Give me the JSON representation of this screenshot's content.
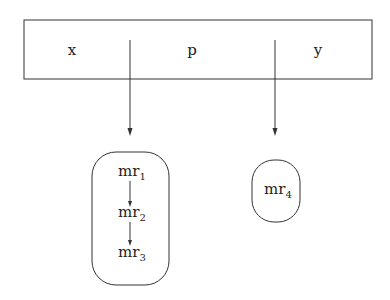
{
  "record": {
    "fields": [
      {
        "label": "x"
      },
      {
        "label": "p"
      },
      {
        "label": "y"
      }
    ]
  },
  "groups": [
    {
      "items": [
        {
          "base": "mr",
          "sub": "1"
        },
        {
          "base": "mr",
          "sub": "2"
        },
        {
          "base": "mr",
          "sub": "3"
        }
      ]
    },
    {
      "items": [
        {
          "base": "mr",
          "sub": "4"
        }
      ]
    }
  ],
  "colors": {
    "stroke": "#333333",
    "background": "#ffffff"
  }
}
